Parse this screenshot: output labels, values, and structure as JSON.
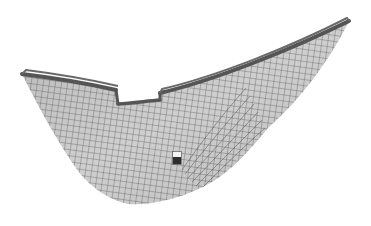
{
  "scene": {
    "description": "3D wireframe-shaded mesh of a curved shell surface with a rectangular notch on the top rim and a small square hole",
    "background": "#ffffff",
    "surface_color": "#c4c4c4",
    "mesh_line_color": "#3a3a3a",
    "rim_color": "#5a5a5a",
    "hole_light": "#f2f2f2",
    "hole_dark": "#2a2a2a"
  }
}
